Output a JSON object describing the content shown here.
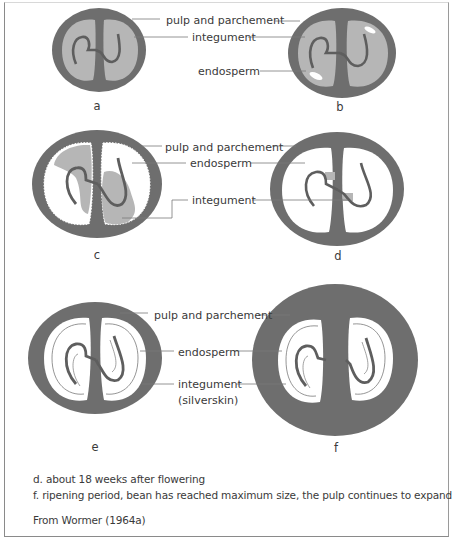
{
  "figure": {
    "colors": {
      "pulp": "#6e6e6e",
      "integument": "#b6b6b6",
      "endosperm": "#ffffff",
      "curve": "#5e5e5e",
      "leader": "#7a7a7a",
      "text": "#3a3a3a"
    },
    "panels": [
      {
        "id": "a",
        "label": "a",
        "labels": {
          "pulp": "pulp and parchement",
          "integument": "integument"
        }
      },
      {
        "id": "b",
        "label": "b",
        "labels": {
          "pulp": "pulp and parchement",
          "integument": "integument",
          "endosperm": "endosperm"
        }
      },
      {
        "id": "c",
        "label": "c",
        "labels": {
          "pulp": "pulp and parchement",
          "endosperm": "endosperm",
          "integument": "integument"
        }
      },
      {
        "id": "d",
        "label": "d",
        "labels": {
          "pulp": "pulp and parchement",
          "endosperm": "endosperm",
          "integument": "integument"
        }
      },
      {
        "id": "e",
        "label": "e",
        "labels": {
          "pulp": "pulp and parchement",
          "endosperm": "endosperm",
          "integument": "integument",
          "integument_sub": "(silverskin)"
        }
      },
      {
        "id": "f",
        "label": "f",
        "labels": {}
      }
    ],
    "row_labels": {
      "row1": {
        "pulp": "pulp and parchement",
        "integument": "integument",
        "endosperm": "endosperm"
      },
      "row2": {
        "pulp": "pulp and parchement",
        "endosperm": "endosperm",
        "integument": "integument"
      },
      "row3": {
        "pulp": "pulp and parchement",
        "endosperm": "endosperm",
        "integument": "integument",
        "integument_sub": "(silverskin)"
      }
    }
  },
  "caption": {
    "line_d": "d. about 18 weeks after flowering",
    "line_f": "f. ripening period, bean has reached maximum size, the pulp continues to expand",
    "source": "From Wormer (1964a)"
  }
}
